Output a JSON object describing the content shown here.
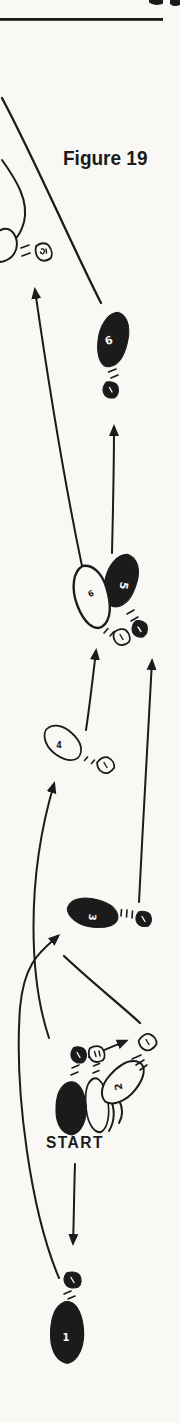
{
  "colors": {
    "ink": "#1b1b1b",
    "paper": "#f9f8f5"
  },
  "figure": {
    "title": "Figure 19"
  },
  "labels": {
    "start": "START"
  },
  "footprints": [
    {
      "number": "1",
      "style": "filled-black"
    },
    {
      "number": "2",
      "style": "outline"
    },
    {
      "number": "3",
      "style": "filled-black"
    },
    {
      "number": "4",
      "style": "outline"
    },
    {
      "number": "5",
      "style": "filled-black"
    },
    {
      "number": "6",
      "style": "outline"
    },
    {
      "number": "6",
      "style": "filled-black"
    },
    {
      "number": "",
      "style": "filled-black",
      "role": "start-left-foot"
    },
    {
      "number": "",
      "style": "outline",
      "role": "start-right-foot"
    },
    {
      "number": "",
      "style": "outline",
      "role": "exit-foot-partial"
    }
  ]
}
